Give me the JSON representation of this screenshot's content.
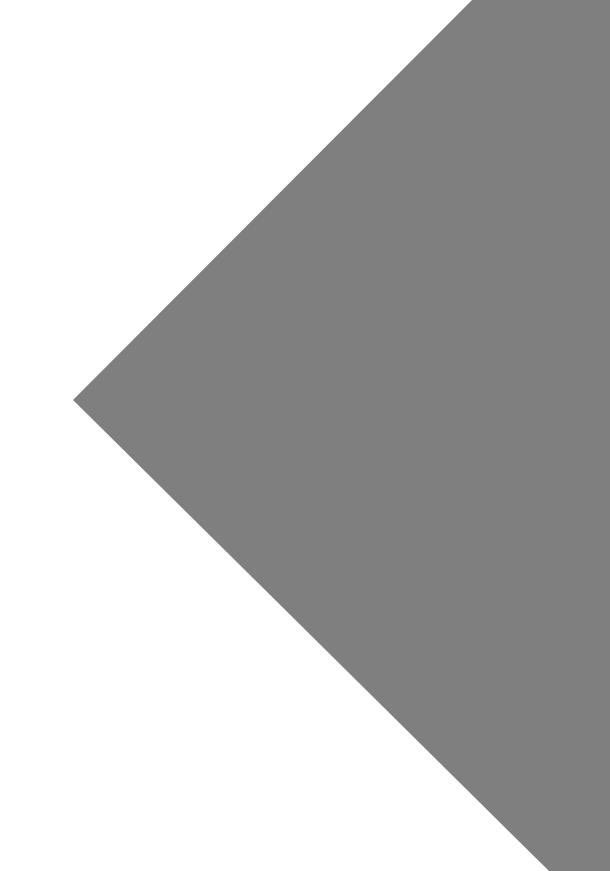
{
  "canvas": {
    "width": 610,
    "height": 871,
    "background_color": "#ffffff",
    "description": "Blank white page with a large flat gray angular shape occupying the right side"
  },
  "shapes": [
    {
      "name": "gray-wedge",
      "type": "polygon",
      "fill_color": "#7f7f7f",
      "stroke": "none",
      "opacity": 1,
      "points": "472,0 610,0 610,871 549,871 73,400",
      "vertex_list": [
        [
          472,
          0
        ],
        [
          610,
          0
        ],
        [
          610,
          871
        ],
        [
          549,
          871
        ],
        [
          73,
          400
        ]
      ],
      "apex": [
        73,
        400
      ],
      "notes": "Leftward pointing apex near mid-height of the left area; two long straight diagonals run up-right and down-right from the apex to the page borders."
    }
  ],
  "palette": {
    "background": "#ffffff",
    "shape_gray": "#7f7f7f"
  },
  "text": {
    "visible_text": "",
    "labels": []
  }
}
